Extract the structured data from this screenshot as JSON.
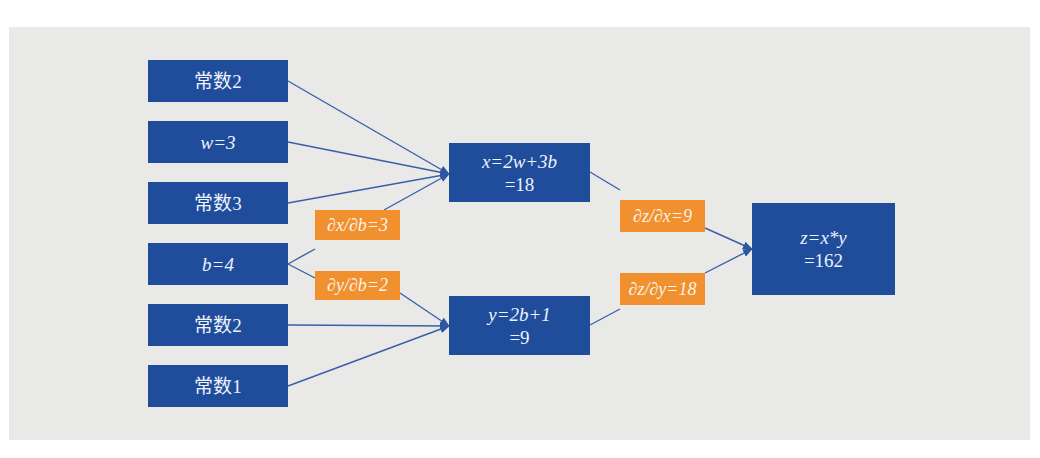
{
  "diagram": {
    "title": "",
    "colors": {
      "background": "#e9e9e7",
      "node": "#1f4d9c",
      "gradient": "#f0902f",
      "edge": "#3a5fa8"
    },
    "inputs": [
      {
        "id": "c2a",
        "label": "常数2"
      },
      {
        "id": "w",
        "label": "w=3"
      },
      {
        "id": "c3",
        "label": "常数3"
      },
      {
        "id": "b",
        "label": "b=4"
      },
      {
        "id": "c2b",
        "label": "常数2"
      },
      {
        "id": "c1",
        "label": "常数1"
      }
    ],
    "intermediate": [
      {
        "id": "x",
        "line1": "x=2w+3b",
        "line2": "=18"
      },
      {
        "id": "y",
        "line1": "y=2b+1",
        "line2": "=9"
      }
    ],
    "output": {
      "id": "z",
      "line1": "z=x*y",
      "line2": "=162"
    },
    "gradients": [
      {
        "id": "dxdb",
        "label": "∂x/∂b=3"
      },
      {
        "id": "dydb",
        "label": "∂y/∂b=2"
      },
      {
        "id": "dzdx",
        "label": "∂z/∂x=9"
      },
      {
        "id": "dzdy",
        "label": "∂z/∂y=18"
      }
    ],
    "edges": [
      {
        "from": "常数2",
        "to": "x"
      },
      {
        "from": "w",
        "to": "x"
      },
      {
        "from": "常数3",
        "to": "x"
      },
      {
        "from": "b",
        "to": "x",
        "via": "∂x/∂b=3"
      },
      {
        "from": "b",
        "to": "y",
        "via": "∂y/∂b=2"
      },
      {
        "from": "常数2",
        "to": "y"
      },
      {
        "from": "常数1",
        "to": "y"
      },
      {
        "from": "x",
        "to": "z",
        "via": "∂z/∂x=9"
      },
      {
        "from": "y",
        "to": "z",
        "via": "∂z/∂y=18"
      }
    ]
  }
}
